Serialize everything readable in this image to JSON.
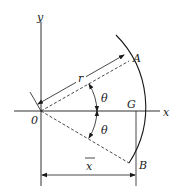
{
  "figure": {
    "type": "geometry-diagram",
    "labels": {
      "y_axis": "y",
      "x_axis": "x",
      "origin": "0",
      "point_a": "A",
      "point_b": "B",
      "centroid": "G",
      "radius": "r",
      "angle_upper": "θ",
      "angle_lower": "θ",
      "x_bar": "x"
    },
    "color": "#1a1a1a"
  }
}
